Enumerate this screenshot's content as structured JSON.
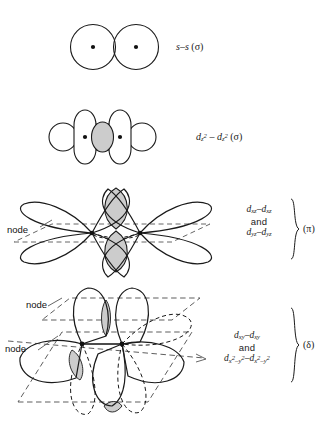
{
  "figure": {
    "background_color": "#ffffff",
    "stroke_color": "#1a1a1a",
    "overlap_fill_color": "#cccccc",
    "dashed_color": "#555555",
    "width": 331,
    "height": 421
  },
  "rows": [
    {
      "id": "s-s-sigma",
      "diagram_name": "s-s-overlap-diagram",
      "description": "Two overlapping spheres with central nuclei dots",
      "label_html": "s–s (σ)",
      "orbital_left": "s",
      "orbital_right": "s",
      "bond_type": "σ",
      "node_labels": []
    },
    {
      "id": "dz2-dz2-sigma",
      "diagram_name": "dz2-dz2-overlap-diagram",
      "description": "Two d z-squared orbitals with toroidal rings overlapping end-on, shaded overlap region",
      "label_html": "d<sub>z<sup>2</sup></sub> – d<sub>z<sup>2</sup></sub> (σ)",
      "orbital_left": "dz2",
      "orbital_right": "dz2",
      "bond_type": "σ",
      "node_labels": []
    },
    {
      "id": "dxz-dyz-pi",
      "diagram_name": "dxz-dxz-overlap-diagram",
      "description": "Two four-lobed d orbitals overlapping side-on with one nodal plane, shaded overlap lobes",
      "label_line1_html": "d<sub>xz</sub>–d<sub>xz</sub>",
      "label_and": "and",
      "label_line2_html": "d<sub>yz</sub>–d<sub>yz</sub>",
      "bond_type": "(π)",
      "node_labels": [
        "node"
      ]
    },
    {
      "id": "dxy-dx2y2-delta",
      "diagram_name": "dxy-dxy-overlap-diagram",
      "description": "Two four-lobed d orbitals overlapping face-to-face with two nodal planes, shown in perspective",
      "label_line1_html": "d<sub>xy</sub>–d<sub>xy</sub>",
      "label_and": "and",
      "label_line2_html": "d<sub>x<sup>2</sup>–y<sup>2</sup></sub>–d<sub>x<sup>2</sup>–y<sup>2</sup></sub>",
      "bond_type": "(δ)",
      "node_labels": [
        "node",
        "node"
      ]
    }
  ]
}
